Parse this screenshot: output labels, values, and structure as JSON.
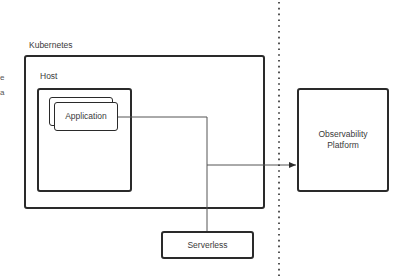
{
  "diagram": {
    "left_edge_fragments": [
      "e",
      "a"
    ],
    "kubernetes": {
      "label": "Kubernetes"
    },
    "host": {
      "label": "Host"
    },
    "application": {
      "label": "Application"
    },
    "observability": {
      "label_line1": "Observability",
      "label_line2": "Platform"
    },
    "serverless": {
      "label": "Serverless"
    },
    "colors": {
      "stroke": "#2a2a2a",
      "connector": "#555555",
      "text": "#3a3a3a",
      "background": "#ffffff"
    }
  }
}
